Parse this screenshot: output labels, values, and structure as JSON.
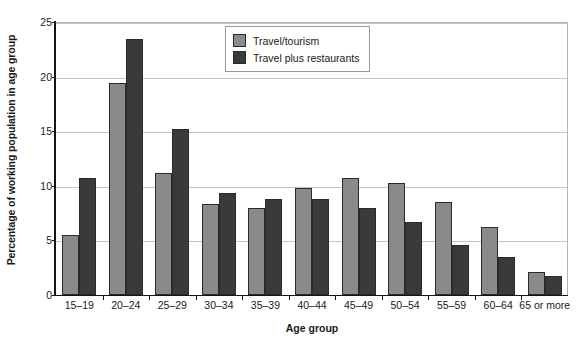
{
  "chart_data": {
    "type": "bar",
    "title": "",
    "xlabel": "Age group",
    "ylabel": "Percentage of working population in age group",
    "categories": [
      "15–19",
      "20–24",
      "25–29",
      "30–34",
      "35–39",
      "40–44",
      "45–49",
      "50–54",
      "55–59",
      "60–64",
      "65 or more"
    ],
    "series": [
      {
        "name": "Travel/tourism",
        "color": "#8a8a8a",
        "values": [
          5.5,
          19.4,
          11.2,
          8.3,
          8.0,
          9.8,
          10.7,
          10.25,
          8.5,
          6.2,
          2.1
        ]
      },
      {
        "name": "Travel plus restaurants",
        "color": "#3a3a3a",
        "values": [
          10.7,
          23.4,
          15.2,
          9.3,
          8.8,
          8.75,
          8.0,
          6.7,
          4.6,
          3.5,
          1.7
        ]
      }
    ],
    "ylim": [
      0,
      25
    ],
    "yticks": [
      0,
      5,
      10,
      15,
      20,
      25
    ],
    "ytick_labels": [
      "0",
      "5",
      "10",
      "15",
      "20",
      "25"
    ],
    "grid": "horizontal",
    "legend_position": "top-center"
  },
  "legend": {
    "entries": [
      {
        "label": "Travel/tourism"
      },
      {
        "label": "Travel plus restaurants"
      }
    ]
  }
}
